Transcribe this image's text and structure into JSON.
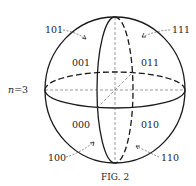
{
  "figure": {
    "caption": "Fig. 2",
    "caption_display": "FIG. 2",
    "parameter_label": "n = 3",
    "parameter_var": "n",
    "parameter_eq": "=3"
  },
  "regions": {
    "front": [
      "001",
      "011",
      "000",
      "010"
    ],
    "back": [
      "101",
      "111",
      "100",
      "110"
    ]
  },
  "labels": {
    "r001": "001",
    "r011": "011",
    "r000": "000",
    "r010": "010",
    "r101": "101",
    "r111": "111",
    "r100": "100",
    "r110": "110"
  },
  "colors": {
    "stroke": "#1a1a1a",
    "dashed_light": "#555555",
    "background": "#ffffff"
  }
}
